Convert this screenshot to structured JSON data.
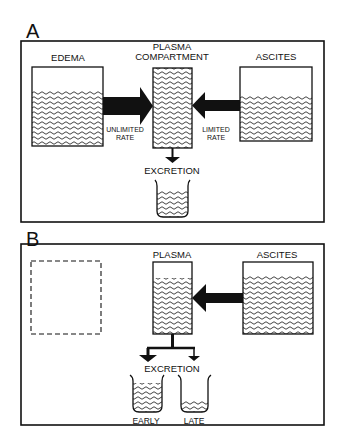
{
  "panel_a": {
    "letter": "A",
    "edema_label": "EDEMA",
    "plasma_label_line1": "PLASMA",
    "plasma_label_line2": "COMPARTMENT",
    "ascites_label": "ASCITES",
    "unlimited_line1": "UNLIMITED",
    "unlimited_line2": "RATE",
    "limited_line1": "LIMITED",
    "limited_line2": "RATE",
    "excretion_label": "EXCRETION"
  },
  "panel_b": {
    "letter": "B",
    "plasma_label": "PLASMA",
    "ascites_label": "ASCITES",
    "excretion_label": "EXCRETION",
    "early_label": "EARLY",
    "late_label": "LATE"
  },
  "colors": {
    "ink": "#111111",
    "background": "#ffffff"
  }
}
